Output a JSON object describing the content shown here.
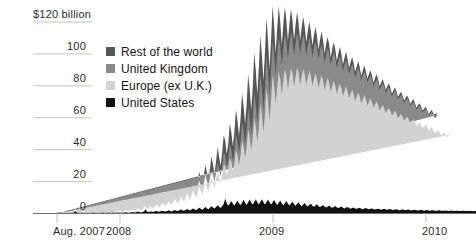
{
  "chart_data": {
    "type": "area",
    "stacked": true,
    "title": "",
    "subtitle": "",
    "xlabel": "",
    "ylabel": "$120 billion",
    "unit_label": "$120 billion",
    "ylim": [
      0,
      120
    ],
    "yticks": [
      0,
      20,
      40,
      60,
      80,
      100,
      120
    ],
    "ytick_labels": [
      "0",
      "20",
      "40",
      "60",
      "80",
      "100",
      "$120 billion"
    ],
    "xticks": [
      "Aug. 2007",
      "2008",
      "2009",
      "2010"
    ],
    "xtick_labels": [
      "Aug. 2007",
      "2008",
      "2009",
      "2010"
    ],
    "grid": true,
    "grid_axis": "y",
    "legend_position": "upper-center-left",
    "legend": [
      {
        "name": "Rest of the world",
        "color": "#575757"
      },
      {
        "name": "United Kingdom",
        "color": "#8a8a8a"
      },
      {
        "name": "Europe (ex U.K.)",
        "color": "#d2d2d2"
      },
      {
        "name": "United States",
        "color": "#111111"
      }
    ],
    "series": [
      {
        "name": "United States",
        "color": "#111111",
        "values": [
          0.2,
          0.2,
          0.3,
          0.2,
          0.3,
          0.4,
          0.3,
          0.5,
          0.4,
          0.3,
          0.4,
          0.6,
          1.6,
          0.6,
          0.4,
          0.5,
          0.4,
          0.3,
          0.4,
          0.5,
          0.4,
          0.3,
          0.4,
          0.5,
          0.6,
          0.4,
          0.3,
          0.4,
          0.5,
          0.4,
          0.6,
          0.5,
          0.4,
          0.5,
          0.6,
          0.5,
          0.4,
          0.6,
          0.5,
          0.4,
          0.6,
          0.7,
          0.5,
          0.4,
          0.6,
          0.8,
          0.6,
          0.5,
          0.7,
          0.9,
          0.8,
          0.6,
          0.9,
          1.2,
          0.9,
          0.7,
          1.0,
          1.4,
          2.6,
          1.1,
          0.9,
          1.3,
          1.2,
          1.0,
          1.4,
          1.6,
          1.3,
          1.1,
          1.5,
          1.8,
          1.4,
          1.2,
          1.6,
          2.0,
          1.6,
          1.3,
          1.8,
          2.2,
          1.8,
          1.5,
          2.0,
          2.5,
          2.0,
          1.7,
          2.2,
          2.8,
          2.3,
          1.9,
          2.5,
          3.2,
          2.6,
          2.1,
          2.8,
          3.6,
          2.9,
          2.4,
          3.2,
          4.0,
          3.3,
          2.7,
          3.6,
          4.6,
          3.8,
          3.1,
          4.1,
          5.2,
          4.3,
          3.5,
          4.6,
          5.9,
          9.2,
          6.4,
          4.8,
          6.2,
          7.8,
          6.1,
          5.0,
          6.5,
          8.2,
          6.4,
          5.2,
          6.8,
          8.6,
          6.7,
          5.4,
          7.0,
          8.8,
          6.9,
          5.6,
          7.2,
          9.0,
          7.0,
          5.7,
          7.3,
          9.0,
          7.0,
          5.7,
          7.2,
          8.8,
          6.9,
          5.6,
          7.0,
          8.5,
          6.7,
          5.4,
          6.8,
          8.2,
          6.4,
          5.2,
          6.5,
          7.8,
          6.1,
          5.0,
          6.2,
          7.4,
          5.8,
          4.8,
          5.9,
          7.0,
          5.5,
          4.6,
          5.6,
          6.6,
          5.2,
          4.4,
          5.3,
          6.2,
          4.9,
          4.2,
          5.0,
          5.8,
          4.6,
          4.0,
          4.7,
          5.4,
          4.3,
          3.8,
          4.4,
          5.0,
          4.0,
          3.6,
          4.1,
          4.7,
          3.8,
          3.4,
          3.9,
          4.4,
          3.6,
          3.2,
          3.7,
          4.1,
          3.4,
          3.0,
          3.5,
          3.8,
          3.2,
          2.9,
          3.3,
          3.6,
          3.0,
          2.7,
          3.1,
          3.4,
          2.9,
          2.6,
          3.0,
          3.2,
          2.7,
          2.5,
          2.8,
          3.0,
          2.6,
          2.4,
          2.7,
          2.9,
          2.5,
          2.3,
          2.6,
          2.8,
          2.4,
          2.2,
          2.5,
          2.7,
          2.3,
          2.1,
          2.4,
          2.6,
          2.2,
          2.0,
          2.3,
          2.5,
          2.1,
          2.0,
          2.2,
          2.4,
          2.0,
          1.9,
          2.1,
          2.3,
          2.0,
          1.8,
          2.0,
          2.2,
          1.9,
          1.8,
          2.0,
          2.1,
          1.8,
          1.7,
          1.9,
          2.0,
          1.8,
          1.7,
          1.8,
          1.9,
          1.7,
          1.6,
          1.8,
          1.9,
          1.6,
          1.6,
          1.7,
          1.8,
          1.6,
          1.5,
          1.7,
          1.7,
          1.5,
          1.5,
          1.6,
          1.7,
          1.5,
          1.4,
          1.6,
          1.6
        ]
      },
      {
        "name": "Europe (ex U.K.)",
        "color": "#d2d2d2",
        "values": [
          0.3,
          0.3,
          0.4,
          0.3,
          0.4,
          0.5,
          0.4,
          0.6,
          0.5,
          0.4,
          0.5,
          0.7,
          1.0,
          0.7,
          0.5,
          0.6,
          0.5,
          0.4,
          0.5,
          0.6,
          0.5,
          0.4,
          0.5,
          0.6,
          0.7,
          0.5,
          0.4,
          0.5,
          0.6,
          0.5,
          0.7,
          0.6,
          0.5,
          0.6,
          0.8,
          0.6,
          0.5,
          0.8,
          0.7,
          0.6,
          0.9,
          1.0,
          0.8,
          0.7,
          1.0,
          1.3,
          1.1,
          0.9,
          1.2,
          1.6,
          1.4,
          1.1,
          1.6,
          2.1,
          1.7,
          1.4,
          2.0,
          2.6,
          2.2,
          1.8,
          2.4,
          3.2,
          2.7,
          2.2,
          3.0,
          3.9,
          3.3,
          2.7,
          3.6,
          4.7,
          4.0,
          3.3,
          4.4,
          5.7,
          4.8,
          4.0,
          5.3,
          6.8,
          5.8,
          4.8,
          6.3,
          8.1,
          6.9,
          5.7,
          7.4,
          9.5,
          8.1,
          6.7,
          8.7,
          11.2,
          9.5,
          7.9,
          10.2,
          13.1,
          11.2,
          9.3,
          12.0,
          15.4,
          13.1,
          10.9,
          14.0,
          18.0,
          15.4,
          12.8,
          16.4,
          21.0,
          18.0,
          15.0,
          19.2,
          24.6,
          21.0,
          17.5,
          22.4,
          28.7,
          24.6,
          20.5,
          26.2,
          33.5,
          28.7,
          24.0,
          30.6,
          39.0,
          33.5,
          28.0,
          35.6,
          45.5,
          39.0,
          32.6,
          41.5,
          53.0,
          45.4,
          38.0,
          48.3,
          61.6,
          52.8,
          44.2,
          56.2,
          71.6,
          61.4,
          51.4,
          65.3,
          80.0,
          72.0,
          62.0,
          74.0,
          82.0,
          76.0,
          68.0,
          78.0,
          84.0,
          79.0,
          72.0,
          80.0,
          85.0,
          80.5,
          74.0,
          81.0,
          85.5,
          81.0,
          75.0,
          81.5,
          85.0,
          81.0,
          75.5,
          81.0,
          84.0,
          80.0,
          75.0,
          80.0,
          83.0,
          79.0,
          74.0,
          79.0,
          82.0,
          78.0,
          73.0,
          78.0,
          80.5,
          77.0,
          72.0,
          76.5,
          79.0,
          75.5,
          71.0,
          75.0,
          77.5,
          74.0,
          70.0,
          73.5,
          76.0,
          72.5,
          69.0,
          72.0,
          74.0,
          71.0,
          67.5,
          70.5,
          72.5,
          69.5,
          66.0,
          69.0,
          71.0,
          68.0,
          65.0,
          67.5,
          69.0,
          66.5,
          63.5,
          66.0,
          67.5,
          65.0,
          62.0,
          64.0,
          65.5,
          63.0,
          60.5,
          62.5,
          63.5,
          61.5,
          59.0,
          60.5,
          62.0,
          60.0,
          57.5,
          59.0,
          60.0,
          58.0,
          56.0,
          57.5,
          58.5,
          56.5,
          54.5,
          56.0,
          57.0,
          55.0,
          53.0,
          54.0,
          55.0,
          53.5,
          51.5,
          52.5,
          53.5,
          52.0,
          50.0,
          51.0,
          52.0,
          50.5,
          48.5,
          49.5,
          50.5,
          49.0,
          47.0,
          48.0,
          49.0,
          47.5,
          46.0,
          47.0,
          47.5
        ]
      },
      {
        "name": "United Kingdom",
        "color": "#8a8a8a",
        "values": [
          0.1,
          0.1,
          0.1,
          0.1,
          0.1,
          0.2,
          0.1,
          0.2,
          0.1,
          0.1,
          0.1,
          0.2,
          0.3,
          0.2,
          0.1,
          0.2,
          0.1,
          0.1,
          0.1,
          0.2,
          0.1,
          0.1,
          0.1,
          0.2,
          0.2,
          0.1,
          0.1,
          0.1,
          0.2,
          0.1,
          0.2,
          0.2,
          0.1,
          0.2,
          0.2,
          0.2,
          0.1,
          0.2,
          0.2,
          0.2,
          0.3,
          0.3,
          0.2,
          0.2,
          0.3,
          0.4,
          0.3,
          0.3,
          0.4,
          0.5,
          0.4,
          0.3,
          0.5,
          0.6,
          0.5,
          0.4,
          0.6,
          0.8,
          0.7,
          0.6,
          0.7,
          1.0,
          0.8,
          0.7,
          0.9,
          1.2,
          1.0,
          0.8,
          1.1,
          1.4,
          1.2,
          1.0,
          1.3,
          1.7,
          1.4,
          1.2,
          1.6,
          2.0,
          1.7,
          1.4,
          1.9,
          2.4,
          2.1,
          1.7,
          2.2,
          2.9,
          2.4,
          2.0,
          2.6,
          3.4,
          2.9,
          2.4,
          3.1,
          3.9,
          3.4,
          2.8,
          3.6,
          4.6,
          3.9,
          3.3,
          4.2,
          5.4,
          4.6,
          3.8,
          4.9,
          6.3,
          5.4,
          4.5,
          5.8,
          7.4,
          6.3,
          5.3,
          6.7,
          8.6,
          7.4,
          6.2,
          7.9,
          10.0,
          8.6,
          7.2,
          9.2,
          11.7,
          10.0,
          8.4,
          10.7,
          13.6,
          11.7,
          9.8,
          12.4,
          15.9,
          13.6,
          11.4,
          14.5,
          18.5,
          15.9,
          13.3,
          16.9,
          20.0,
          18.5,
          16.0,
          18.8,
          21.0,
          19.5,
          17.4,
          19.8,
          21.5,
          20.3,
          18.4,
          20.5,
          22.0,
          20.8,
          19.0,
          21.0,
          22.0,
          21.0,
          19.4,
          21.0,
          21.8,
          20.8,
          19.4,
          20.6,
          21.4,
          20.4,
          19.0,
          20.0,
          20.8,
          19.8,
          18.5,
          19.4,
          20.0,
          19.2,
          18.0,
          18.8,
          19.4,
          18.6,
          17.4,
          18.2,
          18.7,
          18.0,
          16.9,
          17.6,
          18.0,
          17.4,
          16.4,
          17.0,
          17.4,
          16.8,
          15.9,
          16.4,
          16.8,
          16.2,
          15.4,
          15.9,
          16.2,
          15.6,
          14.9,
          15.3,
          15.6,
          15.1,
          14.4,
          14.8,
          15.1,
          14.6,
          13.9,
          14.3,
          14.6,
          14.1,
          13.4,
          13.8,
          14.0,
          13.6,
          13.0,
          13.3,
          13.5,
          13.1,
          12.5,
          12.8,
          13.0,
          12.6,
          12.0,
          12.3,
          12.5,
          12.1,
          11.6,
          11.8,
          12.0,
          11.6,
          11.1,
          11.4,
          11.5,
          11.2,
          10.7,
          10.9,
          11.0,
          10.7,
          10.3,
          10.5,
          10.6,
          10.3,
          9.9,
          10.1,
          10.2,
          9.9,
          9.5,
          9.7,
          9.8,
          9.5,
          9.2,
          9.3,
          9.4
        ]
      },
      {
        "name": "Rest of the world",
        "color": "#575757",
        "values": [
          0.1,
          0.1,
          0.1,
          0.1,
          0.1,
          0.1,
          0.1,
          0.1,
          0.1,
          0.1,
          0.1,
          0.2,
          0.2,
          0.2,
          0.1,
          0.1,
          0.1,
          0.1,
          0.1,
          0.1,
          0.1,
          0.1,
          0.1,
          0.1,
          0.2,
          0.1,
          0.1,
          0.1,
          0.1,
          0.1,
          0.2,
          0.1,
          0.1,
          0.2,
          0.2,
          0.1,
          0.1,
          0.2,
          0.2,
          0.1,
          0.2,
          0.3,
          0.2,
          0.2,
          0.3,
          0.4,
          0.3,
          0.2,
          0.4,
          0.5,
          0.4,
          0.3,
          0.5,
          0.7,
          0.5,
          0.4,
          0.7,
          0.9,
          0.7,
          0.6,
          0.9,
          1.2,
          0.9,
          0.8,
          1.1,
          1.5,
          1.2,
          1.0,
          1.4,
          1.8,
          1.5,
          1.2,
          1.7,
          2.2,
          1.8,
          1.5,
          2.1,
          2.7,
          2.2,
          1.9,
          2.5,
          3.2,
          2.7,
          2.3,
          3.0,
          3.9,
          3.3,
          2.8,
          3.6,
          4.6,
          3.9,
          3.3,
          4.3,
          5.5,
          4.7,
          4.0,
          5.1,
          6.6,
          5.6,
          4.7,
          6.1,
          7.8,
          6.7,
          5.6,
          7.2,
          9.2,
          7.9,
          6.7,
          8.5,
          10.9,
          9.4,
          7.9,
          10.1,
          12.9,
          11.1,
          9.4,
          11.9,
          15.2,
          13.1,
          11.1,
          14.1,
          18.0,
          15.5,
          13.1,
          16.6,
          21.2,
          18.3,
          15.5,
          19.6,
          25.0,
          21.6,
          18.3,
          23.1,
          24.0,
          22.0,
          18.5,
          22.5,
          23.8,
          20.0,
          16.0,
          19.5,
          22.0,
          18.0,
          14.0,
          17.0,
          19.5,
          15.5,
          12.5,
          15.0,
          17.0,
          13.5,
          11.0,
          13.0,
          15.0,
          12.0,
          9.5,
          11.5,
          13.0,
          10.5,
          8.5,
          10.0,
          11.5,
          9.2,
          7.5,
          9.0,
          10.2,
          8.2,
          6.8,
          8.0,
          9.0,
          7.3,
          6.0,
          7.1,
          8.0,
          6.5,
          5.4,
          6.3,
          7.1,
          5.8,
          4.8,
          5.6,
          6.3,
          5.2,
          4.3,
          5.0,
          5.6,
          4.6,
          3.9,
          4.5,
          5.0,
          4.1,
          3.5,
          4.0,
          4.5,
          3.7,
          3.2,
          3.6,
          4.0,
          3.3,
          2.9,
          3.3,
          3.6,
          3.0,
          2.6,
          3.0,
          3.2,
          2.7,
          2.4,
          2.7,
          2.9,
          2.5,
          2.2,
          2.4,
          2.6,
          2.2,
          2.0,
          2.2,
          2.4,
          2.0,
          1.8,
          2.0,
          2.1,
          1.8,
          1.6,
          1.8,
          1.9,
          1.6,
          1.5,
          1.6,
          1.7,
          1.5,
          1.3,
          1.5,
          1.5,
          1.3,
          1.2,
          1.3,
          1.4,
          1.2,
          1.1,
          1.2,
          1.2,
          1.1,
          1.0,
          1.1,
          1.1,
          1.0,
          0.9,
          1.0,
          1.0,
          0.9,
          0.8,
          0.9,
          0.9
        ]
      }
    ]
  },
  "axes": {
    "y_labels": [
      {
        "text": "$120 billion",
        "value": 120
      },
      {
        "text": "100",
        "value": 100
      },
      {
        "text": "80",
        "value": 80
      },
      {
        "text": "60",
        "value": 60
      },
      {
        "text": "40",
        "value": 40
      },
      {
        "text": "20",
        "value": 20
      },
      {
        "text": "0",
        "value": 0
      }
    ],
    "x_labels": [
      {
        "text": "Aug. 2007",
        "pos": 57
      },
      {
        "text": "2008",
        "pos": 120
      },
      {
        "text": "2009",
        "pos": 273
      },
      {
        "text": "2010",
        "pos": 426
      }
    ]
  },
  "colors": {
    "background": "#ffffff",
    "grid": "#bdbdbd",
    "axis": "#6f6f6f",
    "text": "#1a1a1a"
  }
}
